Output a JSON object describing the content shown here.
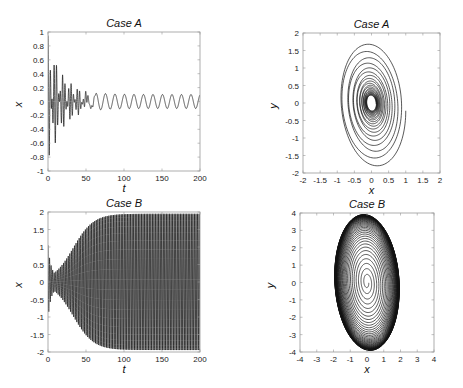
{
  "chart_data": [
    {
      "id": "panel-1",
      "type": "line",
      "title": "Case A",
      "xlabel": "t",
      "ylabel": "x",
      "xlim": [
        0,
        200
      ],
      "ylim": [
        -1,
        1
      ],
      "xticks": [
        0,
        50,
        100,
        150,
        200
      ],
      "yticks": [
        -1,
        -0.8,
        -0.6,
        -0.4,
        -0.2,
        0,
        0.2,
        0.4,
        0.6,
        0.8,
        1
      ],
      "grid": false,
      "description": "Decaying oscillation from amplitude ~1 settling into steady oscillation of amplitude ~0.1",
      "model": {
        "kind": "decay_to_limit",
        "a0": 0.95,
        "a_inf": 0.1,
        "decay": 0.055,
        "period_early": 3.2,
        "period_late": 12.5,
        "t_switch": 60
      },
      "box": {
        "left": 48,
        "top": 32,
        "right": 200,
        "bottom": 171
      }
    },
    {
      "id": "panel-2",
      "type": "line",
      "title": "Case A",
      "xlabel": "x",
      "ylabel": "y",
      "xlim": [
        -2,
        2
      ],
      "ylim": [
        -2,
        2
      ],
      "xticks": [
        -2,
        -1.5,
        -1,
        -0.5,
        0,
        0.5,
        1,
        1.5,
        2
      ],
      "yticks": [
        -2,
        -1.5,
        -1,
        -0.5,
        0,
        0.5,
        1,
        1.5,
        2
      ],
      "grid": false,
      "description": "Phase portrait spiraling inward from outer ellipse (x≈±1, y≈±1.8) to small cycle near origin",
      "model": {
        "kind": "spiral_in",
        "rx0": 1.0,
        "ry0": 1.85,
        "rx_end": 0.1,
        "ry_end": 0.15,
        "turns": 22
      },
      "box": {
        "left": 303,
        "top": 33,
        "right": 440,
        "bottom": 173
      }
    },
    {
      "id": "panel-3",
      "type": "line",
      "title": "Case B",
      "xlabel": "t",
      "ylabel": "x",
      "xlim": [
        0,
        200
      ],
      "ylim": [
        -2,
        2
      ],
      "xticks": [
        0,
        50,
        100,
        150,
        200
      ],
      "yticks": [
        -2,
        -1.5,
        -1,
        -0.5,
        0,
        0.5,
        1,
        1.5,
        2
      ],
      "grid": false,
      "description": "Oscillation growing from ~0.2 amplitude to saturated amplitude ~1.95 by t≈70",
      "model": {
        "kind": "grow_to_limit",
        "a0": 0.15,
        "a_max": 1.95,
        "rate": 0.075,
        "period": 2.05
      },
      "box": {
        "left": 48,
        "top": 212,
        "right": 200,
        "bottom": 352
      }
    },
    {
      "id": "panel-4",
      "type": "line",
      "title": "Case B",
      "xlabel": "x",
      "ylabel": "y",
      "xlim": [
        -4,
        4
      ],
      "ylim": [
        -4,
        4
      ],
      "xticks": [
        -4,
        -3,
        -2,
        -1,
        0,
        1,
        2,
        3,
        4
      ],
      "yticks": [
        -4,
        -3,
        -2,
        -1,
        0,
        1,
        2,
        3,
        4
      ],
      "grid": false,
      "description": "Phase portrait spiraling outward from origin to limit ellipse (x≈±2, y≈±4)",
      "model": {
        "kind": "spiral_out",
        "rx_max": 1.95,
        "ry_max": 3.95,
        "turns": 45
      },
      "box": {
        "left": 300,
        "top": 213,
        "right": 434,
        "bottom": 352
      }
    }
  ]
}
